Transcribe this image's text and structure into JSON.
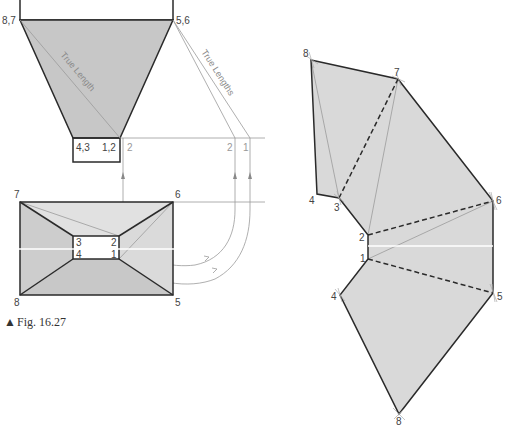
{
  "figure": {
    "caption_marker": "▲",
    "caption": "Fig. 16.27"
  },
  "elevation": {
    "labels": {
      "corner_left": "8,7",
      "corner_right": "5,6",
      "base_left": "4,3",
      "base_right": "1,2",
      "projected_2": "2",
      "true_length_2": "2",
      "true_length_1": "1"
    },
    "annotations": {
      "true_length": "True Length",
      "true_lengths": "True Lengths"
    }
  },
  "plan": {
    "labels": {
      "outer_top_left": "7",
      "outer_top_right": "6",
      "outer_bottom_left": "8",
      "outer_bottom_right": "5",
      "inner_top_left": "3",
      "inner_top_right": "2",
      "inner_bottom_left": "4",
      "inner_bottom_right": "1"
    }
  },
  "development": {
    "labels": {
      "v8_top": "8",
      "v7": "7",
      "v6": "6",
      "v4_top": "4",
      "v3": "3",
      "v2": "2",
      "v1": "1",
      "v4_bottom": "4",
      "v5": "5",
      "v8_bottom": "8"
    }
  },
  "colors": {
    "line": "#2a2a2a",
    "construction_line": "#9a9a9a",
    "fill_light": "#dcdcdc",
    "fill_dark": "#c6c6c6"
  }
}
